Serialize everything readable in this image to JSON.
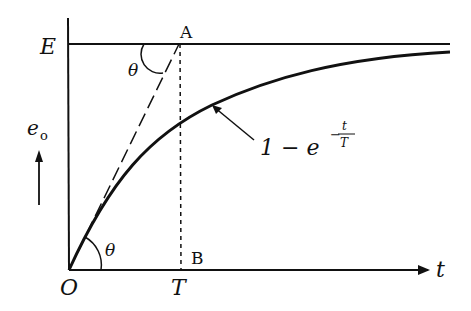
{
  "diagram": {
    "labels": {
      "E": "E",
      "A": "A",
      "B": "B",
      "O": "O",
      "T": "T",
      "t": "t",
      "theta_top": "θ",
      "theta_bottom": "θ",
      "eo_main": "e",
      "eo_sub": "o",
      "curve_formula_prefix": "1 − e",
      "curve_formula_exp_sign": "−",
      "curve_formula_exp_num": "t",
      "curve_formula_exp_den": "T"
    },
    "colors": {
      "ink": "#111111",
      "background": "#ffffff"
    },
    "elements": {
      "y_axis": "vertical axis e_o",
      "x_axis": "horizontal axis t",
      "asymptote": "horizontal line at E",
      "tangent": "dashed tangent line from O to A",
      "vertical_marker": "dotted line from A to B at t = T",
      "curve": "exponential rise 1 - e^(-t/T)"
    }
  }
}
